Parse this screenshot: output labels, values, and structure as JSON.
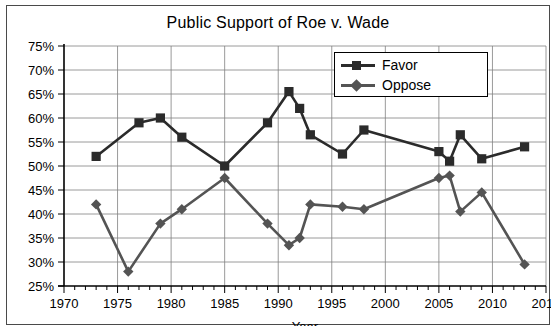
{
  "chart_data": {
    "type": "line",
    "title": "Public Support of Roe v. Wade",
    "xlabel": "Year",
    "ylabel": "",
    "xlim": [
      1970,
      2015
    ],
    "ylim": [
      25,
      75
    ],
    "xticks": [
      1970,
      1975,
      1980,
      1985,
      1990,
      1995,
      2000,
      2005,
      2010,
      2015
    ],
    "xtick_labels": [
      "1970",
      "1975",
      "1980",
      "1985",
      "1990",
      "1995",
      "2000",
      "2005",
      "2010",
      "2015"
    ],
    "xminor_step": 1,
    "yticks": [
      25,
      30,
      35,
      40,
      45,
      50,
      55,
      60,
      65,
      70,
      75
    ],
    "ytick_labels": [
      "25%",
      "30%",
      "35%",
      "40%",
      "45%",
      "50%",
      "55%",
      "60%",
      "65%",
      "70%",
      "75%"
    ],
    "grid": true,
    "legend_position": "top-right-inside",
    "series": [
      {
        "name": "Favor",
        "marker": "square",
        "color": "#2b2b2b",
        "points": [
          {
            "x": 1973,
            "y": 52
          },
          {
            "x": 1977,
            "y": 59
          },
          {
            "x": 1979,
            "y": 60
          },
          {
            "x": 1981,
            "y": 56
          },
          {
            "x": 1985,
            "y": 50
          },
          {
            "x": 1989,
            "y": 59
          },
          {
            "x": 1991,
            "y": 65.5
          },
          {
            "x": 1992,
            "y": 62
          },
          {
            "x": 1993,
            "y": 56.5
          },
          {
            "x": 1996,
            "y": 52.5
          },
          {
            "x": 1998,
            "y": 57.5
          },
          {
            "x": 2005,
            "y": 53
          },
          {
            "x": 2006,
            "y": 51
          },
          {
            "x": 2007,
            "y": 56.5
          },
          {
            "x": 2009,
            "y": 51.5
          },
          {
            "x": 2013,
            "y": 54
          }
        ]
      },
      {
        "name": "Oppose",
        "marker": "diamond",
        "color": "#545454",
        "points": [
          {
            "x": 1973,
            "y": 42
          },
          {
            "x": 1976,
            "y": 28
          },
          {
            "x": 1979,
            "y": 38
          },
          {
            "x": 1981,
            "y": 41
          },
          {
            "x": 1985,
            "y": 47.5
          },
          {
            "x": 1989,
            "y": 38
          },
          {
            "x": 1991,
            "y": 33.5
          },
          {
            "x": 1992,
            "y": 35
          },
          {
            "x": 1993,
            "y": 42
          },
          {
            "x": 1996,
            "y": 41.5
          },
          {
            "x": 1998,
            "y": 41
          },
          {
            "x": 2005,
            "y": 47.5
          },
          {
            "x": 2006,
            "y": 48
          },
          {
            "x": 2007,
            "y": 40.5
          },
          {
            "x": 2009,
            "y": 44.5
          },
          {
            "x": 2013,
            "y": 29.5
          }
        ]
      }
    ],
    "colors": {
      "favor": "#2b2b2b",
      "oppose": "#545454",
      "grid": "#808080",
      "axis": "#000000",
      "background": "#ffffff",
      "frame": "#4a4a4a"
    }
  },
  "legend": {
    "items": [
      {
        "label": "Favor"
      },
      {
        "label": "Oppose"
      }
    ]
  }
}
